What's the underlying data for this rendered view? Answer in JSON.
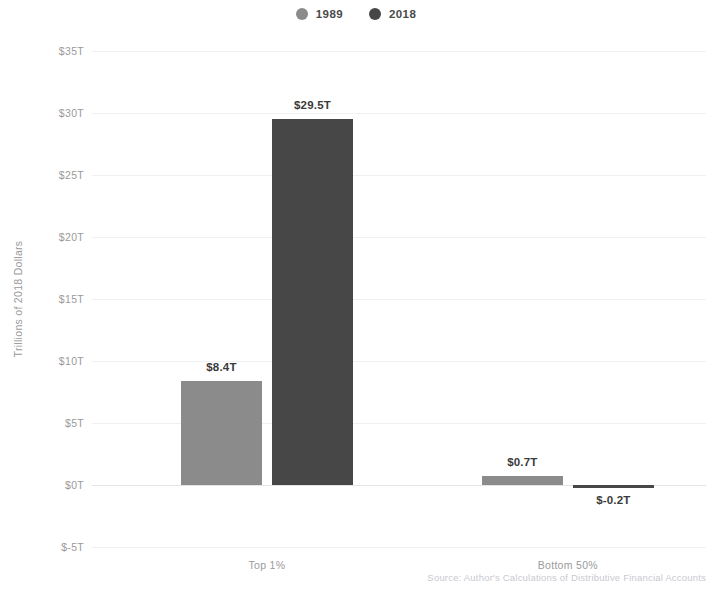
{
  "chart_data": {
    "type": "bar",
    "title": "",
    "xlabel": "",
    "ylabel": "Trillions of 2018 Dollars",
    "categories": [
      "Top 1%",
      "Bottom 50%"
    ],
    "series": [
      {
        "name": "1989",
        "color": "#8b8b8b",
        "values": [
          8.4,
          0.7
        ],
        "labels": [
          "$8.4T",
          "$0.7T"
        ]
      },
      {
        "name": "2018",
        "color": "#474747",
        "values": [
          29.5,
          -0.2
        ],
        "labels": [
          "$29.5T",
          "$-0.2T"
        ]
      }
    ],
    "ylim": [
      -5,
      35
    ],
    "yticks": [
      35,
      30,
      25,
      20,
      15,
      10,
      5,
      0,
      -5
    ],
    "ytick_labels": [
      "$35T",
      "$30T",
      "$25T",
      "$20T",
      "$15T",
      "$10T",
      "$5T",
      "$0T",
      "$-5T"
    ],
    "grid": true,
    "legend_position": "top-center",
    "source_note": "Source: Author's Calculations of Distributive Financial Accounts"
  },
  "legend": {
    "items": [
      {
        "label": "1989",
        "swatch": "legend-dot-1989",
        "color": "#8b8b8b"
      },
      {
        "label": "2018",
        "swatch": "legend-dot-2018",
        "color": "#474747"
      }
    ]
  },
  "axes": {
    "y_title": "Trillions of 2018 Dollars"
  },
  "colors": {
    "series_1989": "#8b8b8b",
    "series_2018": "#474747",
    "gridline": "#f0f0f2",
    "tick_text": "#9a9a9a",
    "value_text": "#3a3a3a",
    "source_text": "#c9c9cf",
    "background": "#ffffff"
  }
}
